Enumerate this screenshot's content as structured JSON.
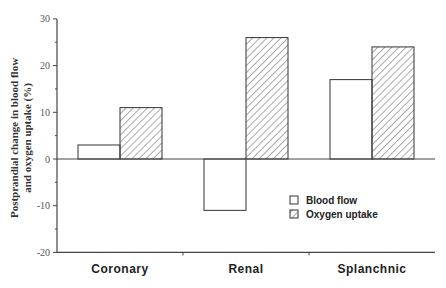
{
  "chart_data": {
    "type": "bar",
    "title": "",
    "categories": [
      "Coronary",
      "Renal",
      "Splanchnic"
    ],
    "series": [
      {
        "name": "Blood flow",
        "values": [
          3,
          -11,
          17
        ],
        "fill": "none"
      },
      {
        "name": "Oxygen uptake",
        "values": [
          11,
          26,
          24
        ],
        "fill": "diagonal-hatch"
      }
    ],
    "xlabel": "",
    "ylabel_line1": "Postprandial change in blood flow",
    "ylabel_line2": "and oxygen uptake (%)",
    "ylim": [
      -20,
      30
    ],
    "yticks": [
      30,
      20,
      10,
      0,
      -10,
      -20
    ],
    "grid": false,
    "legend_position": "lower right",
    "colors": {
      "stroke": "#333333",
      "hatch": "#555555",
      "axis": "#444444"
    }
  }
}
